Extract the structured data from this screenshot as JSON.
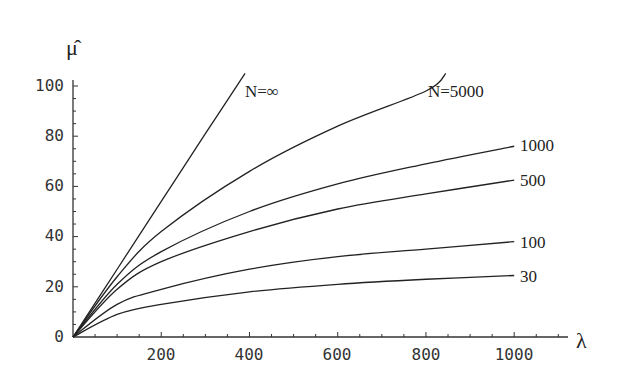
{
  "chart_data": {
    "type": "line",
    "title": "",
    "xlabel": "λ",
    "ylabel": "μ̂",
    "xlim": [
      0,
      1100
    ],
    "ylim": [
      0,
      105
    ],
    "grid": false,
    "legend_position": "inline labels at curve ends",
    "x_ticks": [
      200,
      400,
      600,
      800,
      1000
    ],
    "y_ticks": [
      0,
      20,
      40,
      60,
      80,
      100
    ],
    "series": [
      {
        "name": "N=∞",
        "label": "N=∞",
        "x": [
          0,
          100,
          200,
          300,
          390
        ],
        "values": [
          0,
          27,
          54,
          81,
          105
        ]
      },
      {
        "name": "N=5000",
        "label": "N=5000",
        "x": [
          0,
          100,
          200,
          400,
          600,
          800,
          845
        ],
        "values": [
          0,
          24,
          42,
          66,
          84,
          98,
          105
        ]
      },
      {
        "name": "N=1000",
        "label": "1000",
        "x": [
          0,
          100,
          200,
          400,
          600,
          800,
          1000
        ],
        "values": [
          0,
          21,
          34,
          50,
          61,
          69,
          76
        ]
      },
      {
        "name": "N=500",
        "label": "500",
        "x": [
          0,
          100,
          200,
          400,
          600,
          800,
          1000
        ],
        "values": [
          0,
          19,
          30,
          42,
          51,
          57,
          62.5
        ]
      },
      {
        "name": "N=100",
        "label": "100",
        "x": [
          0,
          100,
          200,
          400,
          600,
          800,
          1000
        ],
        "values": [
          0,
          13,
          19,
          27,
          32,
          35,
          38
        ]
      },
      {
        "name": "N=30",
        "label": "30",
        "x": [
          0,
          100,
          200,
          400,
          600,
          800,
          1000
        ],
        "values": [
          0,
          9,
          13,
          18,
          21,
          23,
          24.5
        ]
      }
    ]
  },
  "axis": {
    "x_title": "λ",
    "y_title": "μ̂",
    "x_tick_labels": [
      "200",
      "400",
      "600",
      "800",
      "1000"
    ],
    "y_tick_labels": [
      "0",
      "20",
      "40",
      "60",
      "80",
      "100"
    ]
  },
  "labels": {
    "inf": "N=∞",
    "n5000": "N=5000",
    "n1000": "1000",
    "n500": "500",
    "n100": "100",
    "n30": "30"
  }
}
